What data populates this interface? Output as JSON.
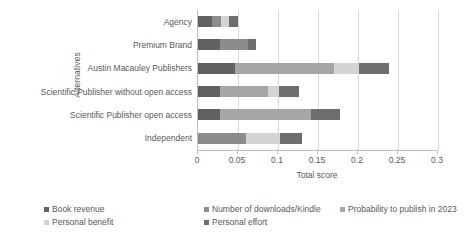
{
  "chart_data": {
    "type": "bar",
    "orientation": "horizontal",
    "stacked": true,
    "title": "",
    "xlabel": "Total score",
    "ylabel": "Alternatives",
    "xlim": [
      0,
      0.3
    ],
    "xticks": [
      "0",
      "0.05",
      "0.1",
      "0.15",
      "0.2",
      "0.25",
      "0.3"
    ],
    "xtick_values": [
      0,
      0.05,
      0.1,
      0.15,
      0.2,
      0.25,
      0.3
    ],
    "grid": true,
    "grid_axis": "x",
    "legend_position": "bottom",
    "categories": [
      "Agency",
      "Premium Brand",
      "Austin Macauley Publishers",
      "Scientific Publisher without open access",
      "Scientific Publisher open access",
      "Independent"
    ],
    "series": [
      {
        "name": "Book revenue",
        "color": "#616161",
        "values": [
          0.018,
          0.027,
          0.046,
          0.027,
          0.027,
          0.0
        ]
      },
      {
        "name": "Number of downloads/Kindle",
        "color": "#8c8c8c",
        "values": [
          0.011,
          0.035,
          0.0,
          0.0,
          0.0,
          0.06
        ]
      },
      {
        "name": "Probability to publish in 2023",
        "color": "#a6a6a6",
        "values": [
          0.0,
          0.0,
          0.124,
          0.061,
          0.114,
          0.0
        ]
      },
      {
        "name": "Personal benefit",
        "color": "#d4d4d4",
        "values": [
          0.01,
          0.0,
          0.031,
          0.013,
          0.0,
          0.043
        ]
      },
      {
        "name": "Personal effort",
        "color": "#6e6e6e",
        "values": [
          0.011,
          0.011,
          0.038,
          0.025,
          0.037,
          0.027
        ]
      }
    ],
    "totals": [
      0.05,
      0.073,
      0.239,
      0.126,
      0.178,
      0.13
    ]
  },
  "legend": {
    "rows": [
      [
        {
          "label": "Book revenue",
          "color": "#616161",
          "left": 0
        },
        {
          "label": "Number of downloads/Kindle",
          "color": "#8c8c8c",
          "left": 160
        },
        {
          "label": "Probability to publish in 2023",
          "color": "#a6a6a6",
          "left": 296
        }
      ],
      [
        {
          "label": "Personal benefit",
          "color": "#d4d4d4",
          "left": 0
        },
        {
          "label": "Personal effort",
          "color": "#6e6e6e",
          "left": 160
        }
      ]
    ]
  }
}
